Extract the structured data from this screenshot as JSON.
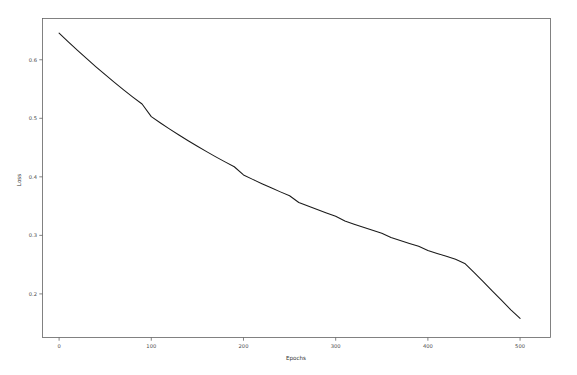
{
  "chart_data": {
    "type": "line",
    "title": "",
    "xlabel": "Epochs",
    "ylabel": "Loss",
    "xlim": [
      -18,
      533
    ],
    "ylim": [
      0.1255,
      0.6705
    ],
    "xticks": [
      0,
      100,
      200,
      300,
      400,
      500
    ],
    "xtick_labels": [
      "0",
      "100",
      "200",
      "300",
      "400",
      "500"
    ],
    "yticks": [
      0.2,
      0.3,
      0.4,
      0.5,
      0.6
    ],
    "ytick_labels": [
      "0.2",
      "0.3",
      "0.4",
      "0.5",
      "0.6"
    ],
    "grid": false,
    "legend": null,
    "series": [
      {
        "name": "Loss",
        "color": "#1a1a1a",
        "x": [
          0,
          10,
          20,
          30,
          40,
          50,
          60,
          70,
          80,
          90,
          100,
          110,
          120,
          130,
          140,
          150,
          160,
          170,
          180,
          190,
          200,
          210,
          220,
          230,
          240,
          250,
          260,
          270,
          280,
          290,
          300,
          310,
          320,
          330,
          340,
          350,
          360,
          370,
          380,
          390,
          400,
          410,
          420,
          430,
          440,
          450,
          460,
          470,
          480,
          490,
          500
        ],
        "values": [
          0.6455,
          0.6305,
          0.616,
          0.6018,
          0.588,
          0.5745,
          0.5614,
          0.5487,
          0.5363,
          0.5244,
          0.5028,
          0.492,
          0.4816,
          0.4715,
          0.4617,
          0.4522,
          0.443,
          0.4341,
          0.4255,
          0.4172,
          0.4032,
          0.3956,
          0.3883,
          0.3812,
          0.3743,
          0.3676,
          0.3562,
          0.35,
          0.344,
          0.3382,
          0.3326,
          0.3245,
          0.3191,
          0.3138,
          0.3086,
          0.3035,
          0.2962,
          0.2912,
          0.2862,
          0.2813,
          0.2742,
          0.2692,
          0.2642,
          0.2592,
          0.2521,
          0.2368,
          0.2208,
          0.2048,
          0.1888,
          0.1728,
          0.1582
        ]
      }
    ]
  },
  "axes": {
    "x_title": "Epochs",
    "y_title": "Loss"
  }
}
